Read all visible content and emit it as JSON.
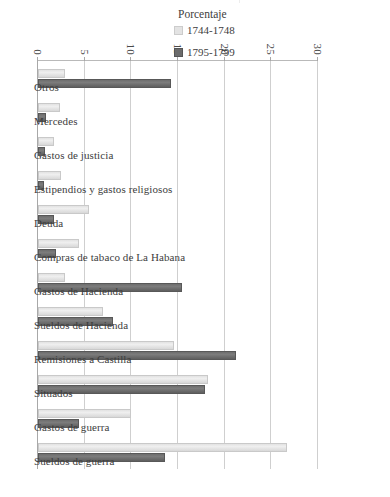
{
  "chart_data": {
    "type": "bar",
    "title": "",
    "xlabel": "",
    "ylabel": "Porcentaje",
    "ylim": [
      0,
      30
    ],
    "yticks": [
      "0",
      "5",
      "10",
      "15",
      "20",
      "25",
      "30"
    ],
    "grid": true,
    "legend_position": "right",
    "orientation": "vertical-rotated-90",
    "categories": [
      "Otros",
      "Mercedes",
      "Gastos de justicia",
      "Estipendios y gastos religiosos",
      "Deuda",
      "Compras de tabaco de La Habana",
      "Gastos de Hacienda",
      "Sueldos de Hacienda",
      "Remisiones a Castilla",
      "Situados",
      "Gastos de guerra",
      "Sueldos de guerra"
    ],
    "series": [
      {
        "name": "1744-1748",
        "color": "#e3e3e3",
        "values": [
          2.9,
          2.4,
          1.7,
          2.5,
          5.5,
          4.4,
          2.9,
          7.0,
          14.6,
          18.2,
          10.0,
          26.7
        ]
      },
      {
        "name": "1795-1799",
        "color": "#6b6b6b",
        "values": [
          14.3,
          0.9,
          0.8,
          0.6,
          1.7,
          1.9,
          15.4,
          8.0,
          21.2,
          17.9,
          4.4,
          13.6
        ]
      }
    ]
  },
  "axis": {
    "value_axis_title": "Porcentaje"
  },
  "legend": {
    "items": [
      {
        "label": "1744-1748",
        "swatch": "light-grey-swatch"
      },
      {
        "label": "1795-1799",
        "swatch": "dark-grey-swatch"
      }
    ]
  }
}
